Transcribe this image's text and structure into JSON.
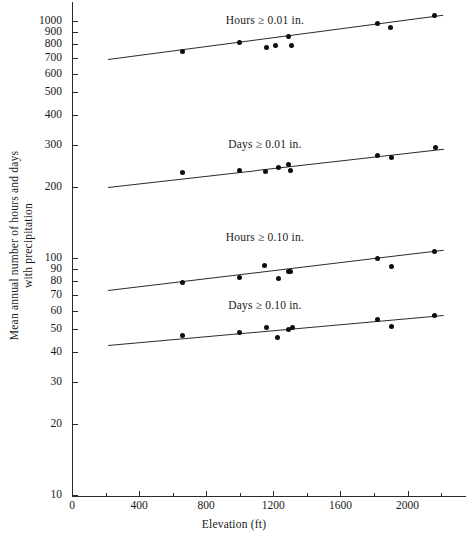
{
  "chart_data": {
    "type": "scatter",
    "title": "",
    "xlabel": "Elevation (ft)",
    "ylabel": "Mean annual number of hours and days with precipitation",
    "yscale": "log",
    "ylim": [
      10,
      1100
    ],
    "xlim": [
      0,
      2250
    ],
    "grid": false,
    "legend_position": "inline-annotations",
    "xticks": [
      0,
      400,
      800,
      1200,
      1600,
      2000
    ],
    "xticklabels": [
      "0",
      "400",
      "800",
      "1200",
      "1600",
      "2000"
    ],
    "xminorticks": [
      200,
      600,
      1000,
      1400,
      1800,
      2200
    ],
    "yticks": [
      10,
      20,
      30,
      40,
      50,
      60,
      70,
      80,
      90,
      100,
      200,
      300,
      400,
      500,
      600,
      700,
      800,
      900,
      1000
    ],
    "yticklabels": [
      "10",
      "20",
      "30",
      "40",
      "50",
      "60",
      "70",
      "80",
      "90",
      "100",
      "200",
      "300",
      "400",
      "500",
      "600",
      "700",
      "800",
      "900",
      "1000"
    ],
    "series": [
      {
        "name": "Hours ≥ 0.01 in.",
        "label": "Hours ≥ 0.01 in.",
        "label_x": 1150,
        "label_y": 1005,
        "points": [
          {
            "x": 660,
            "y": 745
          },
          {
            "x": 1000,
            "y": 810
          },
          {
            "x": 1160,
            "y": 772
          },
          {
            "x": 1215,
            "y": 790
          },
          {
            "x": 1290,
            "y": 860
          },
          {
            "x": 1310,
            "y": 790
          },
          {
            "x": 1820,
            "y": 975
          },
          {
            "x": 1900,
            "y": 940
          },
          {
            "x": 2160,
            "y": 1055
          }
        ],
        "fit": {
          "x1": 215,
          "y1": 690,
          "x2": 2215,
          "y2": 1060
        }
      },
      {
        "name": "Days ≥ 0.01 in.",
        "label": "Days ≥ 0.01 in.",
        "label_x": 1150,
        "label_y": 299,
        "points": [
          {
            "x": 660,
            "y": 230
          },
          {
            "x": 1000,
            "y": 233
          },
          {
            "x": 1155,
            "y": 232
          },
          {
            "x": 1230,
            "y": 240
          },
          {
            "x": 1290,
            "y": 247
          },
          {
            "x": 1300,
            "y": 235
          },
          {
            "x": 1820,
            "y": 271
          },
          {
            "x": 1905,
            "y": 265
          },
          {
            "x": 2165,
            "y": 292
          }
        ],
        "fit": {
          "x1": 215,
          "y1": 200,
          "x2": 2215,
          "y2": 290
        }
      },
      {
        "name": "Hours ≥ 0.10 in.",
        "label": "Hours ≥ 0.10 in.",
        "label_x": 1150,
        "label_y": 122,
        "points": [
          {
            "x": 660,
            "y": 79
          },
          {
            "x": 1000,
            "y": 83
          },
          {
            "x": 1150,
            "y": 93
          },
          {
            "x": 1230,
            "y": 82
          },
          {
            "x": 1290,
            "y": 88
          },
          {
            "x": 1305,
            "y": 88
          },
          {
            "x": 1820,
            "y": 100
          },
          {
            "x": 1905,
            "y": 92
          },
          {
            "x": 2160,
            "y": 107
          }
        ],
        "fit": {
          "x1": 215,
          "y1": 73,
          "x2": 2215,
          "y2": 108
        }
      },
      {
        "name": "Days ≥ 0.10 in.",
        "label": "Days ≥ 0.10 in.",
        "label_x": 1150,
        "label_y": 62.5,
        "points": [
          {
            "x": 660,
            "y": 47
          },
          {
            "x": 1000,
            "y": 48.5
          },
          {
            "x": 1160,
            "y": 51
          },
          {
            "x": 1225,
            "y": 46
          },
          {
            "x": 1290,
            "y": 50
          },
          {
            "x": 1315,
            "y": 51
          },
          {
            "x": 1820,
            "y": 55
          },
          {
            "x": 1905,
            "y": 51.5
          },
          {
            "x": 2160,
            "y": 57
          }
        ],
        "fit": {
          "x1": 215,
          "y1": 43,
          "x2": 2215,
          "y2": 57.5
        }
      }
    ]
  },
  "axes": {
    "x_title": "Elevation (ft)",
    "y_title": "Mean annual number of hours and days with precipitation"
  }
}
